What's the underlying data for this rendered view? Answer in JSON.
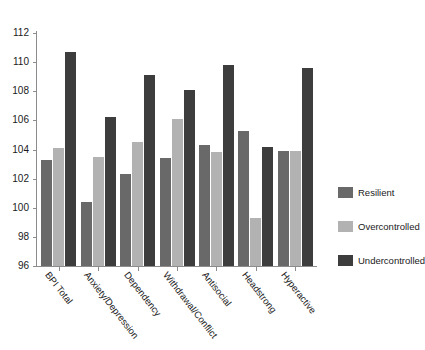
{
  "chart_data": {
    "type": "bar",
    "title": "",
    "subtitle": "",
    "xlabel": "",
    "ylabel": "",
    "ylim": [
      96,
      112
    ],
    "ytick_step": 2,
    "yticks": [
      96,
      98,
      100,
      102,
      104,
      106,
      108,
      110,
      112
    ],
    "grid": false,
    "legend_position": "right",
    "categories": [
      "BPI Total",
      "Anxiety/Depression",
      "Dependency",
      "Withdrawal/Conflict",
      "Antisocial",
      "Headstrong",
      "Hyperactive"
    ],
    "series": [
      {
        "name": "Resilient",
        "color": "#696969",
        "values": [
          103.3,
          100.4,
          102.3,
          103.4,
          104.3,
          105.3,
          103.9
        ]
      },
      {
        "name": "Overcontrolled",
        "color": "#b2b2b2",
        "values": [
          104.1,
          103.5,
          104.5,
          106.1,
          103.8,
          99.3,
          103.9
        ]
      },
      {
        "name": "Undercontrolled",
        "color": "#3d3d3d",
        "values": [
          110.7,
          106.2,
          109.1,
          108.1,
          109.8,
          104.2,
          109.6
        ]
      }
    ]
  },
  "legend": {
    "items": [
      {
        "label": "Resilient",
        "color": "#696969"
      },
      {
        "label": "Overcontrolled",
        "color": "#b2b2b2"
      },
      {
        "label": "Undercontrolled",
        "color": "#3d3d3d"
      }
    ]
  },
  "axis": {
    "y_tick_labels": [
      "112",
      "110",
      "108",
      "106",
      "104",
      "102",
      "100",
      "98",
      "96"
    ],
    "x_tick_labels": [
      "BPI Total",
      "Anxiety/Depression",
      "Dependency",
      "Withdrawal/Conflict",
      "Antisocial",
      "Headstrong",
      "Hyperactive"
    ]
  }
}
